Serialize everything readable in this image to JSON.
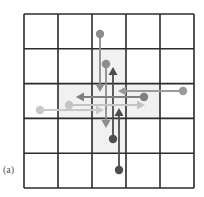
{
  "figure": {
    "label": "(a)",
    "grid": {
      "rows": 5,
      "cols": 5,
      "x0": 24,
      "y0": 14,
      "x1": 194,
      "y1": 188,
      "line_color": "#2b2b2b",
      "shade_color": "#f1f1f1"
    },
    "shaded_cells": [
      [
        1,
        2
      ],
      [
        2,
        1
      ],
      [
        2,
        2
      ],
      [
        2,
        3
      ],
      [
        3,
        2
      ]
    ],
    "vectors": [
      {
        "from": [
          100,
          34
        ],
        "to": [
          100,
          92
        ],
        "color": "#8c8c8c"
      },
      {
        "from": [
          106,
          64
        ],
        "to": [
          106,
          128
        ],
        "color": "#8c8c8c"
      },
      {
        "from": [
          113,
          139
        ],
        "to": [
          113,
          67
        ],
        "color": "#4d4d4d"
      },
      {
        "from": [
          119,
          170
        ],
        "to": [
          119,
          108
        ],
        "color": "#4d4d4d"
      },
      {
        "from": [
          183,
          91
        ],
        "to": [
          118,
          91
        ],
        "color": "#9a9a9a"
      },
      {
        "from": [
          144,
          97
        ],
        "to": [
          76,
          97
        ],
        "color": "#7f7f7f"
      },
      {
        "from": [
          69,
          105
        ],
        "to": [
          145,
          105
        ],
        "color": "#c4c4c4"
      },
      {
        "from": [
          40,
          110
        ],
        "to": [
          104,
          110
        ],
        "color": "#c8c8c8"
      }
    ]
  }
}
